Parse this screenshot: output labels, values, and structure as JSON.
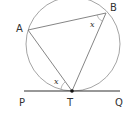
{
  "diagram": {
    "type": "geometry-alternate-segment",
    "colors": {
      "circle": "#9a9a9a",
      "chords": "#777777",
      "tangent": "#333333",
      "point": "#111111",
      "text": "#333333"
    },
    "circle": {
      "cx": 73,
      "cy": 44,
      "r": 47
    },
    "points": {
      "A": {
        "label": "A",
        "x": 28,
        "y": 30
      },
      "B": {
        "label": "B",
        "x": 106,
        "y": 13
      },
      "T": {
        "label": "T",
        "x": 72,
        "y": 91
      }
    },
    "tangent_line": {
      "P": {
        "label": "P",
        "x": 24,
        "y": 91
      },
      "Q": {
        "label": "Q",
        "x": 120,
        "y": 91
      }
    },
    "angles": [
      {
        "label": "x",
        "at": "B",
        "between": [
          "A",
          "T"
        ]
      },
      {
        "label": "x",
        "at": "T",
        "between": [
          "P",
          "A"
        ]
      }
    ]
  }
}
